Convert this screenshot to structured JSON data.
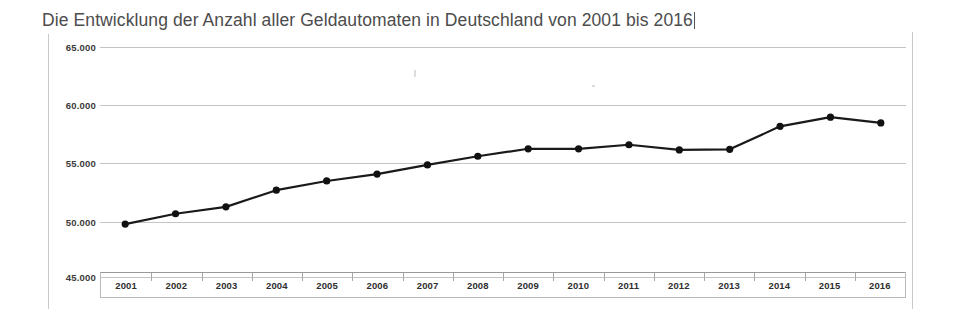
{
  "title": {
    "text": "Die Entwicklung der Anzahl aller Geldautomaten in Deutschland von 2001 bis 2016"
  },
  "chart_data": {
    "type": "line",
    "title": "Die Entwicklung der Anzahl aller Geldautomaten in Deutschland von 2001 bis 2016",
    "xlabel": "",
    "ylabel": "",
    "categories": [
      "2001",
      "2002",
      "2003",
      "2004",
      "2005",
      "2006",
      "2007",
      "2008",
      "2009",
      "2010",
      "2011",
      "2012",
      "2013",
      "2014",
      "2015",
      "2016"
    ],
    "values": [
      49600,
      50500,
      51100,
      52550,
      53350,
      53950,
      54750,
      55500,
      56150,
      56150,
      56500,
      56050,
      56100,
      58100,
      58900,
      58400
    ],
    "series": [
      {
        "name": "Anzahl Geldautomaten",
        "values": [
          49600,
          50500,
          51100,
          52550,
          53350,
          53950,
          54750,
          55500,
          56150,
          56150,
          56500,
          56050,
          56100,
          58100,
          58900,
          58400
        ]
      }
    ],
    "ylim": [
      45000,
      65000
    ],
    "yticks": [
      45000,
      50000,
      55000,
      60000,
      65000
    ],
    "ytick_labels": [
      "45.000",
      "50.000",
      "55.000",
      "60.000",
      "65.000"
    ],
    "grid": true,
    "legend": false,
    "marker": "circle",
    "line_color": "#1a1a1a",
    "marker_color": "#111111",
    "grid_color": "#c4c4c4",
    "background": "#ffffff"
  },
  "axis": {
    "y_labels": [
      "65.000",
      "60.000",
      "55.000",
      "50.000",
      "45.000"
    ],
    "x_labels": [
      "2001",
      "2002",
      "2003",
      "2004",
      "2005",
      "2006",
      "2007",
      "2008",
      "2009",
      "2010",
      "2011",
      "2012",
      "2013",
      "2014",
      "2015",
      "2016"
    ]
  },
  "colors": {
    "line": "#1a1a1a",
    "grid": "#c4c4c4",
    "text": "#3b3b3b",
    "title": "#4c4c4c",
    "frame": "#c9c9c9"
  }
}
